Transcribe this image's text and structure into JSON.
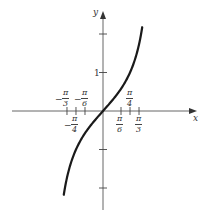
{
  "chart_data": {
    "type": "line",
    "title": "",
    "function": "y = tan(x)",
    "xlabel": "x",
    "ylabel": "y",
    "x_ticks": [
      {
        "value": -1.0472,
        "label": "-π/3"
      },
      {
        "value": -0.7854,
        "label": "-π/4"
      },
      {
        "value": -0.5236,
        "label": "-π/6"
      },
      {
        "value": 0.5236,
        "label": "π/6"
      },
      {
        "value": 0.7854,
        "label": "π/4"
      },
      {
        "value": 1.0472,
        "label": "π/3"
      }
    ],
    "y_ticks": [
      {
        "value": -2,
        "label": ""
      },
      {
        "value": -1,
        "label": ""
      },
      {
        "value": 1,
        "label": "1"
      },
      {
        "value": 2,
        "label": ""
      }
    ],
    "xlim": [
      -2.65,
      2.65
    ],
    "ylim": [
      -2.8,
      2.9
    ],
    "x_range_plotted": [
      -1.14,
      1.14
    ],
    "grid": false,
    "curve_color": "#1a1a1a",
    "axis_color": "#555555"
  },
  "labels": {
    "x_axis": "x",
    "y_axis": "y",
    "y_one": "1",
    "pi": "π",
    "neg_pi_3": {
      "sign": "−",
      "num": "π",
      "den": "3"
    },
    "neg_pi_6": {
      "sign": "−",
      "num": "π",
      "den": "6"
    },
    "neg_pi_4": {
      "sign": "−",
      "num": "π",
      "den": "4"
    },
    "pi_4": {
      "num": "π",
      "den": "4"
    },
    "pi_6": {
      "num": "π",
      "den": "6"
    },
    "pi_3": {
      "num": "π",
      "den": "3"
    }
  }
}
